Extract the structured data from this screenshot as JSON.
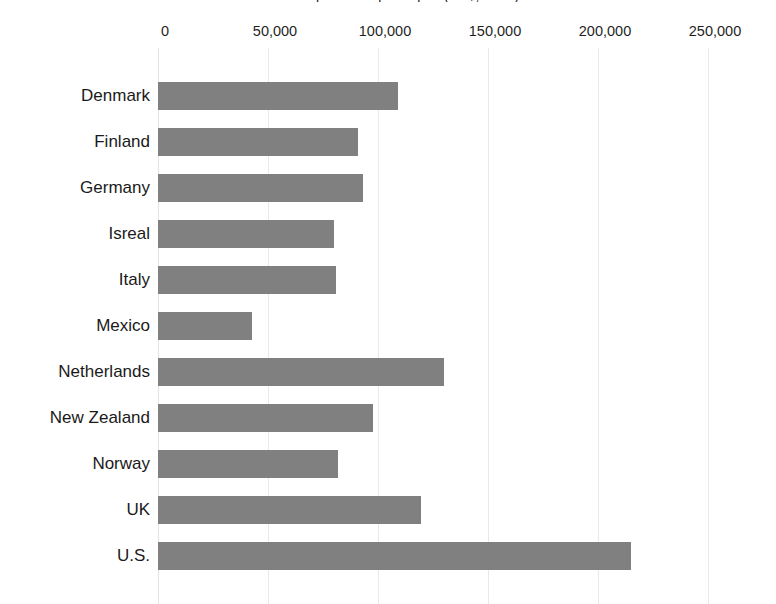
{
  "chart_data": {
    "type": "bar",
    "orientation": "horizontal",
    "title": "Health expenditure per capita (US$, 2014)",
    "xlabel": "",
    "ylabel": "",
    "categories": [
      "Denmark",
      "Finland",
      "Germany",
      "Isreal",
      "Italy",
      "Mexico",
      "Netherlands",
      "New Zealand",
      "Norway",
      "UK",
      "U.S."
    ],
    "values": [
      109000,
      91000,
      93000,
      80000,
      81000,
      42700,
      130000,
      97500,
      82000,
      119500,
      215000
    ],
    "xlim": [
      0,
      250000
    ],
    "xticks": [
      0,
      50000,
      100000,
      150000,
      200000,
      250000
    ],
    "xtick_labels": [
      "0",
      "50,000",
      "100,000",
      "150,000",
      "200,000",
      "250,000"
    ],
    "grid": true,
    "legend": false,
    "bar_color": "#808080",
    "grid_color": "#e9e9e9",
    "text_color": "#1a1a1a",
    "background_color": "#ffffff"
  }
}
